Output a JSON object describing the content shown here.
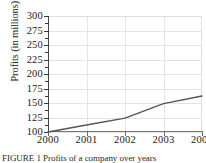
{
  "chart_data": {
    "type": "line",
    "title": "",
    "xlabel": "",
    "ylabel": "Profits (in millions)",
    "x": [
      2000,
      2001,
      2002,
      2003,
      2004
    ],
    "categories": [
      "2000",
      "2001",
      "2002",
      "2003",
      "2004"
    ],
    "values": [
      100,
      112,
      124,
      149,
      162
    ],
    "series": [
      {
        "name": "Profits",
        "values": [
          100,
          112,
          124,
          149,
          162
        ]
      }
    ],
    "xlim": [
      2000,
      2004
    ],
    "ylim": [
      100,
      300
    ],
    "y_ticks": [
      100,
      125,
      150,
      175,
      200,
      225,
      250,
      275,
      300
    ],
    "y_tick_labels": [
      "100",
      "125",
      "150",
      "175",
      "200",
      "225",
      "250",
      "275",
      "300"
    ],
    "y_minor_ticks": [
      112.5,
      137.5,
      162.5,
      187.5,
      212.5,
      237.5,
      262.5,
      287.5
    ],
    "x_ticks": [
      2000,
      2001,
      2002,
      2003,
      2004
    ],
    "x_tick_labels": [
      "2000",
      "2001",
      "2002",
      "2003",
      "2004"
    ],
    "grid": true,
    "grid_axis": "both",
    "legend": false,
    "legend_position": "none",
    "line_color": "#555555",
    "grid_color": "#e4e4e4",
    "axis_color": "#444444",
    "background_color": "#ffffff"
  },
  "caption": {
    "text": "FIGURE 1  Profits of a company over years"
  }
}
